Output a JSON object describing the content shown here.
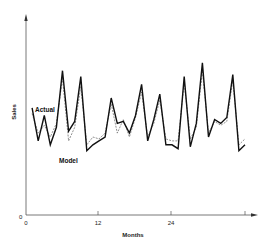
{
  "chart_data": {
    "type": "line",
    "title": "",
    "xlabel": "Months",
    "ylabel": "Sales",
    "x_ticks": [
      "0",
      "12",
      "24",
      ""
    ],
    "y_ticks": [
      "0"
    ],
    "xlim": [
      0,
      37
    ],
    "ylim": [
      0,
      100
    ],
    "grid": false,
    "legend": "inline labels: 'Actual' near start of solid line, 'Model' below first troughs",
    "x": [
      1,
      2,
      3,
      4,
      5,
      6,
      7,
      8,
      9,
      10,
      11,
      12,
      13,
      14,
      15,
      16,
      17,
      18,
      19,
      20,
      21,
      22,
      23,
      24,
      25,
      26,
      27,
      28,
      29,
      30,
      31,
      32,
      33,
      34,
      35,
      36
    ],
    "series": [
      {
        "name": "Actual",
        "style": "solid-thick",
        "values": [
          55,
          38,
          51,
          36,
          45,
          74,
          43,
          48,
          71,
          33,
          36,
          38,
          40,
          60,
          47,
          48,
          42,
          51,
          67,
          38,
          49,
          62,
          36,
          36,
          34,
          71,
          35,
          47,
          78,
          40,
          49,
          47,
          50,
          72,
          33,
          36
        ]
      },
      {
        "name": "Model",
        "style": "dashed-thin",
        "values": [
          52,
          42,
          46,
          40,
          47,
          70,
          38,
          45,
          66,
          36,
          40,
          39,
          42,
          57,
          42,
          49,
          40,
          50,
          63,
          40,
          47,
          59,
          39,
          38,
          38,
          68,
          39,
          45,
          74,
          42,
          48,
          46,
          48,
          69,
          36,
          39
        ]
      }
    ],
    "annotations": [
      {
        "text": "Actual",
        "x": 2,
        "y": 62
      },
      {
        "text": "Model",
        "x": 6.5,
        "y": 32
      }
    ]
  },
  "labels": {
    "xlabel": "Months",
    "ylabel": "Sales",
    "y_zero": "0",
    "x_tick_0": "0",
    "x_tick_12": "12",
    "x_tick_24": "24",
    "actual": "Actual",
    "model": "Model"
  }
}
